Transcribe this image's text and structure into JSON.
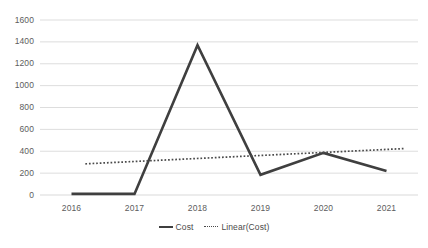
{
  "chart_data": {
    "type": "line",
    "title": "",
    "xlabel": "",
    "ylabel": "",
    "categories": [
      "2016",
      "2017",
      "2018",
      "2019",
      "2020",
      "2021"
    ],
    "ylim": [
      0,
      1600
    ],
    "yticks": [
      0,
      200,
      400,
      600,
      800,
      1000,
      1200,
      1400,
      1600
    ],
    "ytick_labels": [
      "0",
      "200",
      "400",
      "600",
      "800",
      "1000",
      "1200",
      "1400",
      "1600"
    ],
    "grid": "horizontal",
    "legend_position": "bottom-center",
    "series": [
      {
        "name": "Cost",
        "style": "solid",
        "color": "#3f3f3f",
        "values": [
          10,
          10,
          1370,
          185,
          385,
          220
        ]
      },
      {
        "name": "Linear(Cost)",
        "style": "dotted",
        "color": "#4a4a4a",
        "trendline": true,
        "values": [
          285,
          313,
          341,
          369,
          397,
          425
        ],
        "start_value": 285,
        "end_value": 425
      }
    ],
    "legend": [
      {
        "label": "Cost",
        "style": "solid"
      },
      {
        "label": "Linear(Cost)",
        "style": "dotted"
      }
    ]
  },
  "colors": {
    "background": "#ffffff",
    "gridline": "#d9d9d9",
    "tick_text": "#5d5d5d",
    "series_cost": "#3f3f3f",
    "series_trend": "#4a4a4a"
  }
}
